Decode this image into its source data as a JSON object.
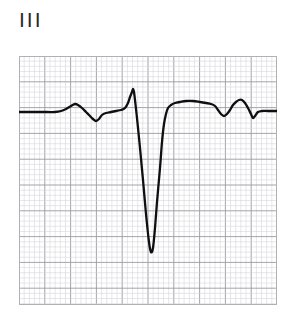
{
  "figure": {
    "kind": "ecg-strip",
    "lead_label": "III",
    "background_color": "#ffffff",
    "trace_color": "#0f0f0f",
    "grid_minor_color": "#cfcfd4",
    "grid_major_color": "#9a9aa2",
    "border_color": "#b0b0b6"
  },
  "grid": {
    "x": 19,
    "y": 56,
    "width": 258,
    "height": 249,
    "minor_step_px": 5.16,
    "major_every": 5,
    "minor_cols": 50,
    "minor_rows": 48,
    "show_border": true
  },
  "chart_data": {
    "type": "line",
    "title": "III",
    "xlabel": "",
    "ylabel": "",
    "series": [
      {
        "name": "Lead III ECG",
        "color": "#0f0f0f",
        "baseline_y_px": 56,
        "points": [
          [
            0,
            56
          ],
          [
            8,
            56
          ],
          [
            18,
            56
          ],
          [
            28,
            56
          ],
          [
            36,
            56
          ],
          [
            42,
            55
          ],
          [
            47,
            53
          ],
          [
            52,
            50
          ],
          [
            56,
            48
          ],
          [
            59,
            49
          ],
          [
            63,
            52
          ],
          [
            67,
            56
          ],
          [
            71,
            60
          ],
          [
            74,
            63
          ],
          [
            77,
            65
          ],
          [
            80,
            63
          ],
          [
            83,
            59
          ],
          [
            87,
            57
          ],
          [
            92,
            56
          ],
          [
            97,
            55
          ],
          [
            102,
            54
          ],
          [
            106,
            52
          ],
          [
            109,
            47
          ],
          [
            111,
            41
          ],
          [
            113,
            36
          ],
          [
            114,
            33
          ],
          [
            115,
            36
          ],
          [
            116,
            44
          ],
          [
            118,
            62
          ],
          [
            121,
            92
          ],
          [
            124,
            124
          ],
          [
            127,
            158
          ],
          [
            130,
            186
          ],
          [
            132,
            196
          ],
          [
            134,
            192
          ],
          [
            136,
            172
          ],
          [
            138,
            146
          ],
          [
            141,
            112
          ],
          [
            143,
            86
          ],
          [
            145,
            68
          ],
          [
            147,
            58
          ],
          [
            149,
            52
          ],
          [
            152,
            49
          ],
          [
            156,
            47
          ],
          [
            161,
            46
          ],
          [
            167,
            45
          ],
          [
            174,
            45
          ],
          [
            181,
            46
          ],
          [
            187,
            47
          ],
          [
            192,
            48
          ],
          [
            196,
            50
          ],
          [
            199,
            54
          ],
          [
            202,
            58
          ],
          [
            205,
            60
          ],
          [
            208,
            58
          ],
          [
            211,
            54
          ],
          [
            214,
            49
          ],
          [
            217,
            46
          ],
          [
            220,
            44
          ],
          [
            223,
            44
          ],
          [
            226,
            47
          ],
          [
            229,
            52
          ],
          [
            232,
            58
          ],
          [
            234,
            62
          ],
          [
            236,
            60
          ],
          [
            239,
            56
          ],
          [
            243,
            55
          ],
          [
            249,
            55
          ],
          [
            255,
            55
          ],
          [
            258,
            55
          ]
        ],
        "features": [
          {
            "name": "P-wave",
            "x": 56,
            "y": 48
          },
          {
            "name": "Q-dip",
            "x": 77,
            "y": 65
          },
          {
            "name": "R-peak",
            "x": 114,
            "y": 33
          },
          {
            "name": "S-trough",
            "x": 132,
            "y": 196
          },
          {
            "name": "ST-segment",
            "x": 174,
            "y": 45
          },
          {
            "name": "T-wave-dip",
            "x": 205,
            "y": 60
          },
          {
            "name": "T-wave-peak",
            "x": 222,
            "y": 44
          },
          {
            "name": "U-dip",
            "x": 234,
            "y": 62
          }
        ]
      }
    ],
    "grid": true,
    "legend": false
  }
}
